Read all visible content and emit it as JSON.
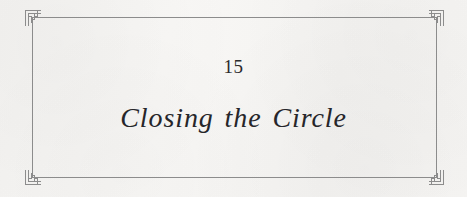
{
  "page": {
    "type": "book-chapter-title-page",
    "background_color": "#f6f5f3",
    "text_color": "#26262a"
  },
  "frame": {
    "line_color": "#8c8c8c",
    "ornament_name": "greek-key-spiral-meander",
    "corners": [
      {
        "position": "top-left",
        "icon": "greek-key-corner-icon"
      },
      {
        "position": "top-right",
        "icon": "greek-key-corner-icon"
      },
      {
        "position": "bottom-left",
        "icon": "greek-key-corner-icon"
      },
      {
        "position": "bottom-right",
        "icon": "greek-key-corner-icon"
      }
    ]
  },
  "content": {
    "chapter_number": "15",
    "chapter_title": "Closing the Circle"
  }
}
